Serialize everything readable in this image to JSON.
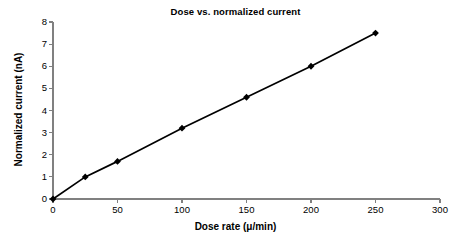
{
  "chart_data": {
    "type": "line",
    "title": "Dose vs. normalized current",
    "xlabel": "Dose rate (μ/min)",
    "ylabel": "Normalized current (nA)",
    "x": [
      0,
      25,
      50,
      100,
      150,
      200,
      250
    ],
    "values": [
      0,
      1.0,
      1.7,
      3.2,
      4.6,
      6.0,
      7.5
    ],
    "series": [
      {
        "name": "Normalized current",
        "values": [
          0,
          1.0,
          1.7,
          3.2,
          4.6,
          6.0,
          7.5
        ]
      }
    ],
    "xlim": [
      0,
      300
    ],
    "ylim": [
      0,
      8
    ],
    "xticks": [
      0,
      50,
      100,
      150,
      200,
      250,
      300
    ],
    "yticks": [
      0,
      1,
      2,
      3,
      4,
      5,
      6,
      7,
      8
    ],
    "xtick_labels": [
      "0",
      "50",
      "100",
      "150",
      "200",
      "250",
      "300"
    ],
    "ytick_labels": [
      "0",
      "1",
      "2",
      "3",
      "4",
      "5",
      "6",
      "7",
      "8"
    ],
    "grid": false,
    "legend": false,
    "marker": "diamond",
    "line_color": "#000000",
    "marker_color": "#000000",
    "axis_color": "#808080",
    "background_color": "#ffffff"
  }
}
